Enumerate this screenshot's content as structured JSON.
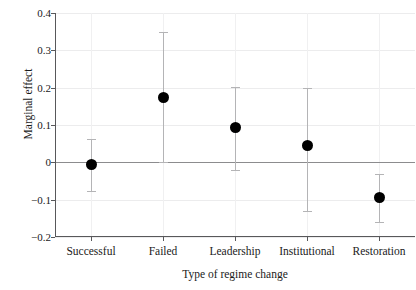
{
  "chart_data": {
    "type": "scatter",
    "title": "",
    "xlabel": "Type of regime change",
    "ylabel": "Marginal effect",
    "categories": [
      "Successful",
      "Failed",
      "Leadership",
      "Institutional",
      "Restoration"
    ],
    "values": [
      -0.007,
      0.175,
      0.093,
      0.045,
      -0.094
    ],
    "error_low": [
      -0.077,
      0.0,
      -0.02,
      -0.13,
      -0.16
    ],
    "error_high": [
      0.062,
      0.35,
      0.201,
      0.2,
      -0.03
    ],
    "ylim": [
      -0.2,
      0.4
    ],
    "yticks": [
      0.4,
      0.3,
      0.2,
      0.1,
      0,
      -0.1,
      -0.2
    ],
    "ytick_labels": [
      "0.4",
      "0.3",
      "0.2",
      "0.1",
      "0",
      "−0.1",
      "−0.2"
    ],
    "grid": true,
    "legend": "none",
    "zero_reference_line": true,
    "marker": "filled-circle",
    "marker_color": "#000000",
    "errorbar_color": "#b4b4b6",
    "gridline_color": "#ececed",
    "axis_color": "#58585a",
    "zeroline_color": "#8c8c8e",
    "background": "#ffffff"
  }
}
